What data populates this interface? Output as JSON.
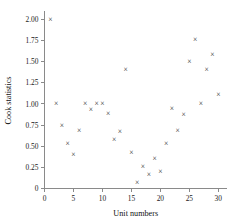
{
  "chart_data": {
    "type": "scatter",
    "title": "",
    "xlabel": "Unit numbers",
    "ylabel": "Cook statistics",
    "xlim": [
      0,
      31.5
    ],
    "ylim": [
      0,
      2.08
    ],
    "xticks": [
      0,
      5,
      10,
      15,
      20,
      25,
      30
    ],
    "xtick_labels": [
      "0",
      "5",
      "10",
      "15",
      "20",
      "25",
      "30"
    ],
    "yticks": [
      0,
      0.25,
      0.5,
      0.75,
      1.0,
      1.25,
      1.5,
      1.75,
      2.0
    ],
    "ytick_labels": [
      "0",
      "0.25",
      "0.50",
      "0.75",
      "1.00",
      "1.25",
      "1.50",
      "1.75",
      "2.00"
    ],
    "grid": false,
    "legend": false,
    "marker": "x",
    "marker_glyph": "×",
    "marker_color": "#2a2a2a",
    "x": [
      1,
      2,
      3,
      4,
      5,
      6,
      7,
      8,
      9,
      10,
      11,
      12,
      13,
      14,
      15,
      16,
      17,
      18,
      19,
      20,
      21,
      22,
      23,
      24,
      25,
      26,
      27,
      28,
      29,
      30
    ],
    "y": [
      2.0,
      1.01,
      0.75,
      0.54,
      0.41,
      0.69,
      1.01,
      0.94,
      1.01,
      1.01,
      0.89,
      0.58,
      0.68,
      1.41,
      0.43,
      0.08,
      0.26,
      0.17,
      0.36,
      0.2,
      0.53,
      0.95,
      0.69,
      0.88,
      1.51,
      1.77,
      1.01,
      1.41,
      1.59,
      1.12
    ],
    "points": [
      {
        "x": 1,
        "y": 2.0
      },
      {
        "x": 2,
        "y": 1.01
      },
      {
        "x": 3,
        "y": 0.75
      },
      {
        "x": 4,
        "y": 0.54
      },
      {
        "x": 5,
        "y": 0.41
      },
      {
        "x": 6,
        "y": 0.69
      },
      {
        "x": 7,
        "y": 1.01
      },
      {
        "x": 8,
        "y": 0.94
      },
      {
        "x": 9,
        "y": 1.01
      },
      {
        "x": 10,
        "y": 1.01
      },
      {
        "x": 11,
        "y": 0.89
      },
      {
        "x": 12,
        "y": 0.58
      },
      {
        "x": 13,
        "y": 0.68
      },
      {
        "x": 14,
        "y": 1.41
      },
      {
        "x": 15,
        "y": 0.43
      },
      {
        "x": 16,
        "y": 0.08
      },
      {
        "x": 17,
        "y": 0.26
      },
      {
        "x": 18,
        "y": 0.17
      },
      {
        "x": 19,
        "y": 0.36
      },
      {
        "x": 20,
        "y": 0.2
      },
      {
        "x": 21,
        "y": 0.53
      },
      {
        "x": 22,
        "y": 0.95
      },
      {
        "x": 23,
        "y": 0.69
      },
      {
        "x": 24,
        "y": 0.88
      },
      {
        "x": 25,
        "y": 1.51
      },
      {
        "x": 26,
        "y": 1.77
      },
      {
        "x": 27,
        "y": 1.01
      },
      {
        "x": 28,
        "y": 1.41
      },
      {
        "x": 29,
        "y": 1.59
      },
      {
        "x": 30,
        "y": 1.12
      }
    ]
  }
}
